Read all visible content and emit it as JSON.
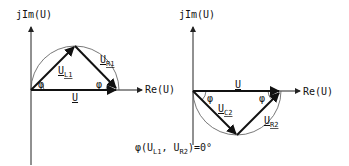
{
  "diagrams": [
    {
      "name": "series-RL-phasor",
      "y_axis_label": "jIm(U)",
      "x_axis_label": "Re(U)",
      "vectors": [
        {
          "label": "U",
          "sub": "L1"
        },
        {
          "label": "U",
          "sub": "R1"
        },
        {
          "label": "U",
          "sub": ""
        }
      ],
      "angle_label": "φ"
    },
    {
      "name": "series-RC-phasor",
      "y_axis_label": "jIm(U)",
      "x_axis_label": "Re(U)",
      "vectors": [
        {
          "label": "U",
          "sub": "C2"
        },
        {
          "label": "U",
          "sub": "R2"
        },
        {
          "label": "U",
          "sub": ""
        }
      ],
      "angle_label": "φ"
    }
  ],
  "caption": {
    "prefix": "φ(U",
    "sub1": "L1",
    "mid": ", U",
    "sub2": "R2",
    "suffix": ")=0°"
  }
}
